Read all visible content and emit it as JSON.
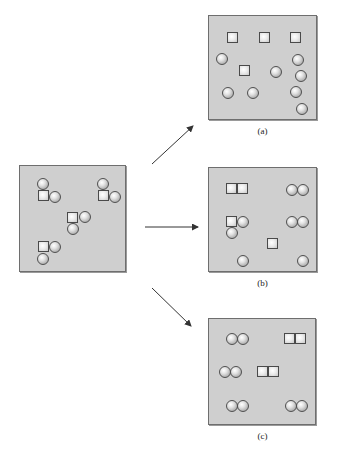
{
  "colors": {
    "panel_fill": "#cfcfcf",
    "panel_border": "#6e6e6e",
    "arrow": "#333333"
  },
  "panels": [
    {
      "id": "initial",
      "caption": "",
      "x": 19,
      "y": 165,
      "w": 107,
      "h": 107,
      "shapes": [
        {
          "t": "ball",
          "x": 17,
          "y": 12
        },
        {
          "t": "sq",
          "x": 18,
          "y": 24
        },
        {
          "t": "ball",
          "x": 29,
          "y": 25
        },
        {
          "t": "ball",
          "x": 77,
          "y": 12
        },
        {
          "t": "sq",
          "x": 78,
          "y": 24
        },
        {
          "t": "sq",
          "x": 78,
          "y": 24
        },
        {
          "t": "ball",
          "x": 89,
          "y": 25
        },
        {
          "t": "sq",
          "x": 47,
          "y": 46
        },
        {
          "t": "ball",
          "x": 59,
          "y": 45
        },
        {
          "t": "ball",
          "x": 47,
          "y": 57
        },
        {
          "t": "sq",
          "x": 18,
          "y": 75
        },
        {
          "t": "ball",
          "x": 29,
          "y": 75
        },
        {
          "t": "ball",
          "x": 17,
          "y": 87
        }
      ]
    },
    {
      "id": "a",
      "caption": "(a)",
      "x": 208,
      "y": 15,
      "w": 109,
      "h": 105,
      "shapes": [
        {
          "t": "sq",
          "x": 18,
          "y": 16
        },
        {
          "t": "sq",
          "x": 50,
          "y": 16
        },
        {
          "t": "sq",
          "x": 81,
          "y": 16
        },
        {
          "t": "ball",
          "x": 7,
          "y": 37
        },
        {
          "t": "sq",
          "x": 30,
          "y": 49
        },
        {
          "t": "ball",
          "x": 61,
          "y": 50
        },
        {
          "t": "ball",
          "x": 83,
          "y": 38
        },
        {
          "t": "ball",
          "x": 86,
          "y": 54
        },
        {
          "t": "ball",
          "x": 13,
          "y": 71
        },
        {
          "t": "ball",
          "x": 38,
          "y": 71
        },
        {
          "t": "ball",
          "x": 81,
          "y": 70
        },
        {
          "t": "ball",
          "x": 87,
          "y": 87
        }
      ]
    },
    {
      "id": "b",
      "caption": "(b)",
      "x": 208,
      "y": 167,
      "w": 109,
      "h": 105,
      "shapes": [
        {
          "t": "sq",
          "x": 17,
          "y": 15
        },
        {
          "t": "sq",
          "x": 28,
          "y": 15
        },
        {
          "t": "ball",
          "x": 77,
          "y": 16
        },
        {
          "t": "ball",
          "x": 88,
          "y": 16
        },
        {
          "t": "sq",
          "x": 17,
          "y": 48
        },
        {
          "t": "ball",
          "x": 28,
          "y": 48
        },
        {
          "t": "ball",
          "x": 17,
          "y": 59
        },
        {
          "t": "ball",
          "x": 77,
          "y": 48
        },
        {
          "t": "ball",
          "x": 88,
          "y": 48
        },
        {
          "t": "sq",
          "x": 58,
          "y": 70
        },
        {
          "t": "ball",
          "x": 28,
          "y": 87
        },
        {
          "t": "ball",
          "x": 88,
          "y": 87
        }
      ]
    },
    {
      "id": "c",
      "caption": "(c)",
      "x": 208,
      "y": 318,
      "w": 108,
      "h": 107,
      "shapes": [
        {
          "t": "ball",
          "x": 17,
          "y": 14
        },
        {
          "t": "ball",
          "x": 28,
          "y": 14
        },
        {
          "t": "sq",
          "x": 75,
          "y": 14
        },
        {
          "t": "sq",
          "x": 86,
          "y": 14
        },
        {
          "t": "ball",
          "x": 10,
          "y": 47
        },
        {
          "t": "ball",
          "x": 21,
          "y": 47
        },
        {
          "t": "sq",
          "x": 48,
          "y": 47
        },
        {
          "t": "sq",
          "x": 59,
          "y": 47
        },
        {
          "t": "ball",
          "x": 17,
          "y": 81
        },
        {
          "t": "ball",
          "x": 28,
          "y": 81
        },
        {
          "t": "ball",
          "x": 76,
          "y": 81
        },
        {
          "t": "ball",
          "x": 87,
          "y": 81
        }
      ]
    }
  ],
  "captions": {
    "a": "(a)",
    "b": "(b)",
    "c": "(c)"
  },
  "arrows": [
    {
      "name": "arrow-to-a",
      "x1": 152,
      "y1": 164,
      "x2": 193,
      "y2": 126
    },
    {
      "name": "arrow-to-b",
      "x1": 145,
      "y1": 227,
      "x2": 198,
      "y2": 227
    },
    {
      "name": "arrow-to-c",
      "x1": 152,
      "y1": 288,
      "x2": 191,
      "y2": 326
    }
  ]
}
